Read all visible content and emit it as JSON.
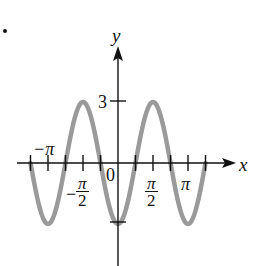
{
  "chart_data": {
    "type": "line",
    "title": "",
    "function": "y = -3cos(2x)",
    "xlabel": "x",
    "ylabel": "y",
    "xlim": [
      -3.927,
      3.927
    ],
    "ylim": [
      -3,
      3
    ],
    "x_tick_labels": [
      "−π",
      "−π/2",
      "0",
      "π/2",
      "π"
    ],
    "x_ticks": [
      "-5π/4",
      "-π",
      "-3π/4",
      "-π/2",
      "-π/4",
      "π/4",
      "π/2",
      "3π/4",
      "π",
      "5π/4"
    ],
    "y_tick_labels": [
      "3"
    ],
    "y_ticks": [
      3,
      -3
    ],
    "series": [
      {
        "name": "y = -3cos(2x)",
        "color": "#9a9a9a",
        "x": [
          -3.927,
          -3.534,
          -3.1416,
          -2.749,
          -2.356,
          -1.963,
          -1.5708,
          -1.178,
          -0.785,
          -0.393,
          0,
          0.393,
          0.785,
          1.178,
          1.5708,
          1.963,
          2.356,
          2.749,
          3.1416,
          3.534,
          3.927
        ],
        "values": [
          0,
          -2.12,
          -3,
          -2.12,
          0,
          2.12,
          3,
          2.12,
          0,
          -2.12,
          -3,
          -2.12,
          0,
          2.12,
          3,
          2.12,
          0,
          -2.12,
          -3,
          -2.12,
          0
        ]
      }
    ],
    "grid": false,
    "legend": null
  },
  "labels": {
    "x_axis": "x",
    "y_axis": "y",
    "y_three": "3",
    "origin": "0",
    "neg_pi": "−π",
    "pi": "π",
    "pi_num": "π",
    "two": "2",
    "minus": "−"
  },
  "colors": {
    "curve": "#9a9a9a",
    "axis": "#111111"
  }
}
